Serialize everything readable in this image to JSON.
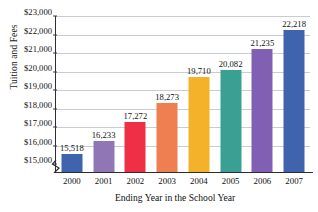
{
  "chart_data": {
    "type": "bar",
    "title": "",
    "xlabel": "Ending Year in the School Year",
    "ylabel": "Tuition and Fees",
    "categories": [
      "2000",
      "2001",
      "2002",
      "2003",
      "2004",
      "2005",
      "2006",
      "2007"
    ],
    "values": [
      15518,
      16233,
      17272,
      18273,
      19710,
      20082,
      21235,
      22218
    ],
    "data_labels": [
      "15,518",
      "16,233",
      "17,272",
      "18,273",
      "19,710",
      "20,082",
      "21,235",
      "22,218"
    ],
    "bar_colors": [
      "#3f63ad",
      "#9076b5",
      "#ee2f46",
      "#ef7f51",
      "#f3b229",
      "#3ba094",
      "#8160b4",
      "#3f63ad"
    ],
    "ylim": [
      15000,
      23000
    ],
    "ytick_values": [
      15000,
      16000,
      17000,
      18000,
      19000,
      20000,
      21000,
      22000,
      23000
    ],
    "ytick_labels": [
      "$15,000",
      "$16,000",
      "$17,000",
      "$18,000",
      "$19,000",
      "$20,000",
      "$21,000",
      "$22,000",
      "$23,000"
    ],
    "grid": "horizontal",
    "legend": "none",
    "axis_break": "y-axis below $15,000",
    "gridline_color": "#c9ccd2",
    "axis_color": "#2e2e2e"
  }
}
